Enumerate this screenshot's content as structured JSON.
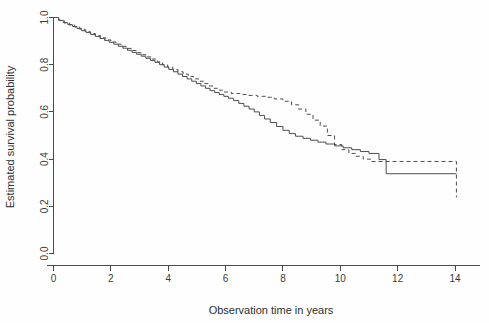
{
  "chart_data": {
    "type": "line",
    "title": "",
    "subtitle": "",
    "xlabel": "Observation time in years",
    "ylabel": "Estimated survival probability",
    "xlim": [
      0,
      15
    ],
    "ylim": [
      0.0,
      1.0
    ],
    "grid": false,
    "legend_position": "none",
    "xticks": [
      "0",
      "2",
      "4",
      "6",
      "8",
      "10",
      "12",
      "14"
    ],
    "xtick_values": [
      0,
      2,
      4,
      6,
      8,
      10,
      12,
      14
    ],
    "yticks": [
      "0.0",
      "0.2",
      "0.4",
      "0.6",
      "0.8",
      "1.0"
    ],
    "ytick_values": [
      0.0,
      0.2,
      0.4,
      0.6,
      0.8,
      1.0
    ],
    "colors": {
      "axis": "#4a4a4a",
      "solid_series": "#4d4d4d",
      "dashed_series": "#4d4d4d",
      "background": "#fefefe"
    },
    "series": [
      {
        "name": "solid-curve",
        "style": "solid",
        "x": [
          0.0,
          0.18,
          0.34,
          0.5,
          0.66,
          0.82,
          0.98,
          1.14,
          1.3,
          1.46,
          1.62,
          1.78,
          1.94,
          2.1,
          2.26,
          2.42,
          2.58,
          2.74,
          2.9,
          3.06,
          3.22,
          3.38,
          3.54,
          3.7,
          3.86,
          4.02,
          4.18,
          4.34,
          4.5,
          4.66,
          4.82,
          4.98,
          5.14,
          5.3,
          5.46,
          5.62,
          5.78,
          5.94,
          6.1,
          6.28,
          6.46,
          6.64,
          6.82,
          7.0,
          7.18,
          7.36,
          7.56,
          7.78,
          8.0,
          8.22,
          8.44,
          8.7,
          8.96,
          9.22,
          9.5,
          9.8,
          10.1,
          10.4,
          10.7,
          11.0,
          11.35,
          11.6,
          14.05
        ],
        "y": [
          1.0,
          0.988,
          0.978,
          0.97,
          0.962,
          0.953,
          0.944,
          0.936,
          0.928,
          0.92,
          0.911,
          0.903,
          0.895,
          0.887,
          0.878,
          0.87,
          0.861,
          0.852,
          0.844,
          0.836,
          0.827,
          0.818,
          0.81,
          0.8,
          0.79,
          0.78,
          0.77,
          0.76,
          0.75,
          0.74,
          0.73,
          0.72,
          0.71,
          0.7,
          0.69,
          0.682,
          0.674,
          0.666,
          0.658,
          0.648,
          0.636,
          0.624,
          0.612,
          0.6,
          0.585,
          0.57,
          0.555,
          0.538,
          0.522,
          0.508,
          0.497,
          0.488,
          0.48,
          0.472,
          0.464,
          0.456,
          0.448,
          0.44,
          0.432,
          0.424,
          0.398,
          0.338,
          0.338
        ]
      },
      {
        "name": "dashed-curve",
        "style": "dashed",
        "x": [
          0.0,
          0.2,
          0.38,
          0.56,
          0.74,
          0.92,
          1.1,
          1.28,
          1.46,
          1.64,
          1.82,
          2.0,
          2.18,
          2.36,
          2.54,
          2.72,
          2.9,
          3.08,
          3.26,
          3.44,
          3.62,
          3.8,
          3.98,
          4.16,
          4.34,
          4.52,
          4.7,
          4.88,
          5.06,
          5.24,
          5.42,
          5.6,
          5.78,
          5.96,
          6.2,
          6.5,
          6.8,
          7.1,
          7.4,
          7.7,
          8.0,
          8.3,
          8.55,
          8.8,
          9.05,
          9.3,
          9.55,
          9.8,
          10.05,
          10.3,
          10.55,
          10.8,
          11.05,
          14.05,
          14.05
        ],
        "y": [
          1.0,
          0.987,
          0.977,
          0.968,
          0.959,
          0.95,
          0.941,
          0.932,
          0.923,
          0.914,
          0.905,
          0.896,
          0.887,
          0.878,
          0.869,
          0.86,
          0.851,
          0.842,
          0.833,
          0.824,
          0.812,
          0.8,
          0.79,
          0.78,
          0.77,
          0.76,
          0.75,
          0.74,
          0.73,
          0.72,
          0.71,
          0.7,
          0.692,
          0.684,
          0.678,
          0.674,
          0.67,
          0.666,
          0.662,
          0.655,
          0.645,
          0.63,
          0.612,
          0.59,
          0.565,
          0.54,
          0.5,
          0.462,
          0.44,
          0.424,
          0.412,
          0.4,
          0.39,
          0.39,
          0.238
        ]
      }
    ]
  },
  "axes": {
    "x_title": "Observation time in years",
    "y_title": "Estimated survival probability"
  }
}
